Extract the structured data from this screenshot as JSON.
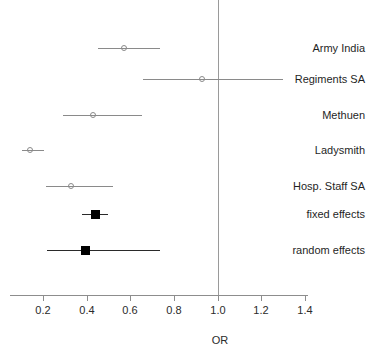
{
  "chart_data": {
    "type": "forest",
    "title": "",
    "xlabel": "OR",
    "ylabel": "",
    "xlim": [
      0.1,
      1.45
    ],
    "grid": false,
    "legend": "none",
    "reference_line": 1.0,
    "xticks": [
      0.2,
      0.4,
      0.6,
      0.8,
      1.0,
      1.2,
      1.4
    ],
    "xticklabels": [
      "0.2",
      "0.4",
      "0.6",
      "0.8",
      "1.0",
      "1.2",
      "1.4"
    ],
    "categories": [
      "Army India",
      "Regiments SA",
      "Methuen",
      "Ladysmith",
      "Hosp. Staff SA",
      "fixed effects",
      "random effects"
    ],
    "rows": [
      {
        "label": "Army India",
        "or": 0.575,
        "ci_low": 0.45,
        "ci_high": 0.735,
        "marker": "open-circle",
        "kind": "study"
      },
      {
        "label": "Regiments SA",
        "or": 0.93,
        "ci_low": 0.66,
        "ci_high": 1.3,
        "marker": "open-circle",
        "kind": "study"
      },
      {
        "label": "Methuen",
        "or": 0.43,
        "ci_low": 0.29,
        "ci_high": 0.655,
        "marker": "open-circle",
        "kind": "study"
      },
      {
        "label": "Ladysmith",
        "or": 0.145,
        "ci_low": 0.105,
        "ci_high": 0.205,
        "marker": "open-circle",
        "kind": "study"
      },
      {
        "label": "Hosp. Staff SA",
        "or": 0.33,
        "ci_low": 0.215,
        "ci_high": 0.52,
        "marker": "open-circle",
        "kind": "study"
      },
      {
        "label": "fixed effects",
        "or": 0.44,
        "ci_low": 0.38,
        "ci_high": 0.5,
        "marker": "filled-square",
        "kind": "summary"
      },
      {
        "label": "random effects",
        "or": 0.395,
        "ci_low": 0.22,
        "ci_high": 0.735,
        "marker": "filled-square",
        "kind": "summary"
      }
    ],
    "colors": {
      "study_marker": "#8a8a8a",
      "study_line": "#8a8a8a",
      "summary_marker": "#000000",
      "summary_line": "#2a2a2a",
      "axis": "#8d8d8d",
      "reference_line": "#9a9a9a",
      "text": "#1f1f1f",
      "background": "#ffffff"
    }
  }
}
